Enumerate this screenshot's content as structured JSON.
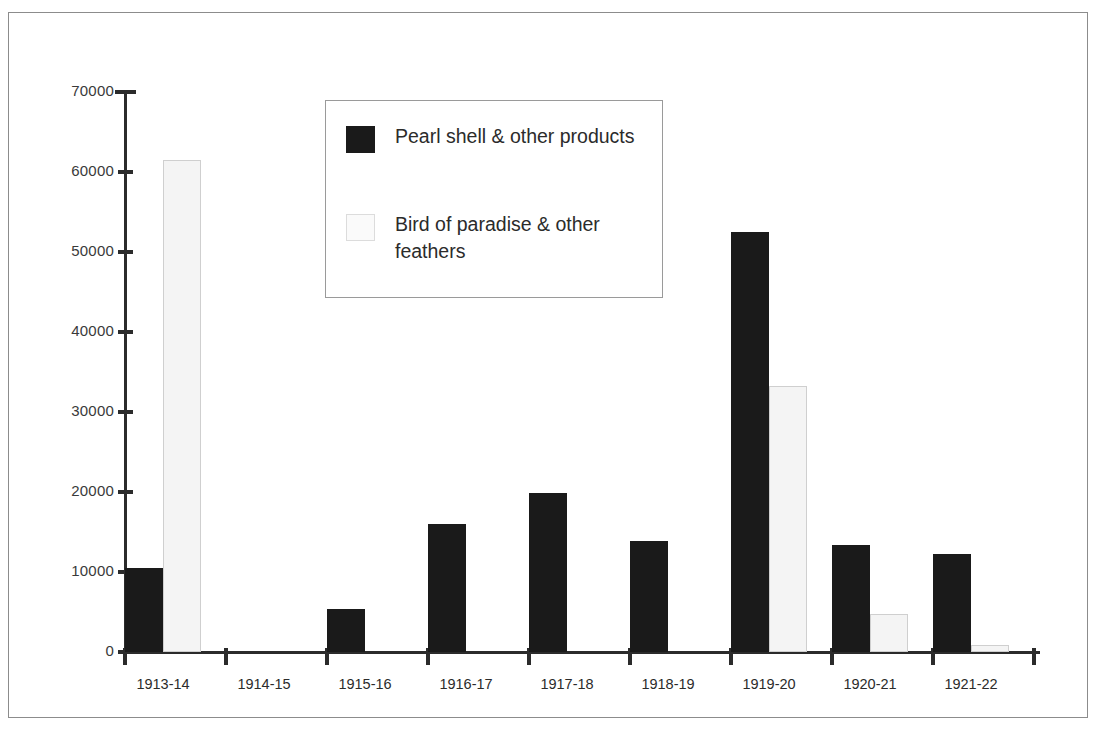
{
  "chart_data": {
    "type": "bar",
    "title": "",
    "subtitle": "",
    "xlabel": "",
    "ylabel": "",
    "categories": [
      "1913-14",
      "1914-15",
      "1915-16",
      "1916-17",
      "1917-18",
      "1918-19",
      "1919-20",
      "1920-21",
      "1921-22"
    ],
    "series": [
      {
        "name": "Pearl shell & other products",
        "color": "#1a1a1a",
        "values": [
          10500,
          0,
          5400,
          16000,
          19900,
          13900,
          52500,
          13400,
          12300
        ]
      },
      {
        "name": "Bird of paradise & other feathers",
        "color": "#f4f4f4",
        "values": [
          61500,
          0,
          0,
          0,
          0,
          0,
          33200,
          4700,
          900
        ]
      }
    ],
    "ylim": [
      0,
      70000
    ],
    "ytick_values": [
      0,
      10000,
      20000,
      30000,
      40000,
      50000,
      60000,
      70000
    ],
    "ytick_labels": [
      "0",
      "10000",
      "20000",
      "30000",
      "40000",
      "50000",
      "60000",
      "70000"
    ],
    "grid": false,
    "legend_position": "top-center-inside",
    "axis_color": "#2b2b2b",
    "background": "#ffffff"
  },
  "legend": {
    "items": [
      {
        "label": "Pearl shell & other products",
        "swatch": "dark-square-swatch"
      },
      {
        "label": "Bird of paradise & other feathers",
        "swatch": "light-square-swatch"
      }
    ]
  }
}
